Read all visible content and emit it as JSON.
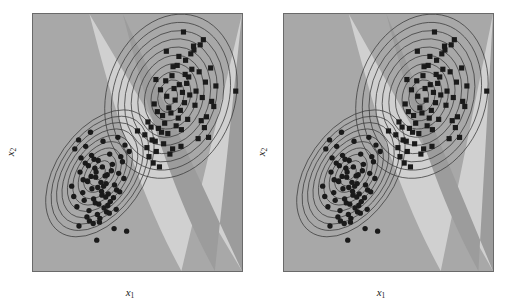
{
  "figure": {
    "title": "",
    "panel_count": 2,
    "background_color": "#ffffff"
  },
  "axes": {
    "x_label_var": "x",
    "x_label_sub": "1",
    "y_label_var": "x",
    "y_label_sub": "2",
    "ticks_visible": false,
    "frame_color": "#6a6a6a"
  },
  "colors": {
    "region_class1": "#a8a8a8",
    "region_margin": "#d0d0d0",
    "region_class2": "#9c9c9c",
    "contour_line": "#3a3a3a",
    "marker": "#1a1a1a",
    "frame": "#6a6a6a",
    "page": "#ffffff"
  },
  "chart_data": {
    "type": "scatter",
    "title": "",
    "xlabel": "x1",
    "ylabel": "x2",
    "xlim": [
      0,
      100
    ],
    "ylim": [
      0,
      100
    ],
    "grid": false,
    "legend": "none",
    "panels": [
      {
        "name": "left-panel",
        "label": "",
        "decision_regions": [
          {
            "name": "class2-region-upper",
            "color": "#9c9c9c"
          },
          {
            "name": "margin-band",
            "color": "#d0d0d0"
          },
          {
            "name": "class1-region-lower",
            "color": "#a8a8a8"
          }
        ],
        "boundary_note": "curved quadratic boundary running from upper-left to lower-right, with a light margin band between two darker regions",
        "contours": [
          {
            "name": "class1-gaussian",
            "center": [
              32,
              38
            ],
            "angle_deg": -55,
            "levels": 10,
            "max_rx": 34,
            "max_ry": 17
          },
          {
            "name": "class2-gaussian",
            "center": [
              66,
              68
            ],
            "angle_deg": -72,
            "levels": 10,
            "max_rx": 40,
            "max_ry": 25
          }
        ],
        "series": [
          {
            "name": "class-1",
            "marker": "circle",
            "color": "#1a1a1a",
            "x": [
              27.5,
              40.6,
              20.0,
              33.5,
              25.0,
              36.7,
              44.0,
              29.6,
              22.5,
              31.2,
              38.0,
              26.0,
              34.5,
              42.0,
              18.5,
              30.0,
              23.8,
              37.5,
              28.2,
              35.0,
              24.5,
              32.8,
              41.0,
              21.0,
              29.0,
              33.0,
              26.8,
              39.0,
              31.5,
              36.0,
              25.8,
              34.0,
              43.5,
              27.0,
              30.8,
              38.5,
              22.0,
              35.8,
              28.8,
              32.0,
              46.0,
              19.5,
              33.8,
              40.0,
              24.0,
              29.8,
              37.0,
              31.0,
              26.5,
              35.2,
              23.0,
              42.8,
              30.2,
              34.8,
              27.8,
              39.8,
              25.2,
              32.5,
              36.5,
              28.0,
              44.8,
              21.8,
              31.8,
              38.8,
              33.2,
              29.2,
              35.5,
              26.2,
              41.5,
              30.5
            ],
            "y": [
              54.0,
              52.0,
              47.5,
              50.5,
              42.0,
              45.5,
              49.0,
              40.0,
              38.5,
              43.0,
              41.5,
              35.0,
              37.0,
              44.5,
              33.0,
              36.5,
              30.5,
              39.0,
              32.0,
              34.0,
              27.5,
              31.0,
              38.0,
              25.0,
              28.0,
              29.5,
              23.5,
              33.5,
              26.0,
              30.0,
              21.0,
              24.5,
              36.0,
              19.5,
              22.0,
              28.5,
              17.5,
              25.5,
              18.5,
              20.5,
              46.5,
              29.0,
              33.0,
              31.5,
              35.5,
              26.5,
              27.0,
              32.5,
              41.0,
              23.0,
              44.0,
              42.5,
              38.5,
              28.8,
              36.8,
              24.0,
              48.5,
              34.5,
              22.5,
              45.0,
              15.5,
              51.0,
              19.0,
              16.5,
              40.5,
              43.5,
              37.5,
              34.8,
              30.8,
              12.0
            ]
          },
          {
            "name": "class-2",
            "marker": "square",
            "color": "#1a1a1a",
            "x": [
              55.0,
              72.0,
              63.5,
              80.0,
              58.0,
              69.0,
              75.5,
              61.0,
              85.0,
              66.5,
              53.5,
              77.0,
              70.0,
              59.5,
              82.5,
              64.0,
              73.0,
              56.5,
              68.0,
              79.5,
              62.0,
              86.5,
              71.5,
              57.0,
              74.5,
              65.0,
              81.0,
              60.0,
              67.5,
              76.0,
              54.5,
              83.0,
              69.5,
              63.0,
              78.0,
              58.5,
              72.5,
              66.0,
              84.0,
              61.5,
              70.5,
              55.5,
              80.5,
              64.5,
              75.0,
              59.0,
              68.5,
              87.5,
              73.5,
              62.5,
              77.5,
              57.5,
              71.0,
              66.8,
              82.0,
              60.5,
              74.0,
              85.5,
              65.5,
              79.0,
              97.0,
              50.0,
              69.8,
              63.8,
              76.8,
              58.8,
              72.8,
              67.0,
              81.5,
              70.8
            ],
            "y": [
              58.0,
              93.0,
              74.0,
              88.0,
              65.0,
              80.0,
              84.5,
              70.5,
              79.0,
              76.0,
              53.0,
              86.0,
              72.5,
              62.0,
              73.5,
              68.0,
              82.0,
              56.0,
              66.5,
              77.5,
              60.5,
              64.0,
              69.5,
              51.0,
              75.5,
              63.5,
              67.5,
              55.5,
              71.0,
              78.5,
              48.0,
              60.0,
              59.5,
              57.5,
              70.0,
              50.5,
              65.5,
              61.5,
              52.0,
              54.0,
              62.5,
              44.5,
              58.5,
              53.5,
              68.5,
              46.5,
              56.5,
              72.0,
              73.0,
              49.5,
              64.5,
              42.0,
              55.0,
              47.5,
              55.8,
              40.5,
              59.0,
              66.0,
              45.5,
              51.5,
              70.0,
              54.5,
              83.5,
              85.5,
              87.5,
              74.5,
              76.5,
              79.5,
              90.0,
              48.5
            ]
          }
        ]
      },
      {
        "name": "right-panel",
        "label": "",
        "decision_regions": [
          {
            "name": "class2-region-upper",
            "color": "#9c9c9c"
          },
          {
            "name": "margin-band",
            "color": "#d0d0d0"
          },
          {
            "name": "class1-region-lower",
            "color": "#a8a8a8"
          }
        ],
        "boundary_note": "same data, slightly wider margin band; boundary shifted right at bottom",
        "contours": [
          {
            "name": "class1-gaussian",
            "center": [
              32,
              38
            ],
            "angle_deg": -55,
            "levels": 10,
            "max_rx": 34,
            "max_ry": 17
          },
          {
            "name": "class2-gaussian",
            "center": [
              66,
              68
            ],
            "angle_deg": -72,
            "levels": 10,
            "max_rx": 40,
            "max_ry": 25
          }
        ],
        "series": [
          {
            "name": "class-1",
            "marker": "circle",
            "color": "#1a1a1a",
            "x": [
              27.5,
              40.6,
              20.0,
              33.5,
              25.0,
              36.7,
              44.0,
              29.6,
              22.5,
              31.2,
              38.0,
              26.0,
              34.5,
              42.0,
              18.5,
              30.0,
              23.8,
              37.5,
              28.2,
              35.0,
              24.5,
              32.8,
              41.0,
              21.0,
              29.0,
              33.0,
              26.8,
              39.0,
              31.5,
              36.0,
              25.8,
              34.0,
              43.5,
              27.0,
              30.8,
              38.5,
              22.0,
              35.8,
              28.8,
              32.0,
              46.0,
              19.5,
              33.8,
              40.0,
              24.0,
              29.8,
              37.0,
              31.0,
              26.5,
              35.2,
              23.0,
              42.8,
              30.2,
              34.8,
              27.8,
              39.8,
              25.2,
              32.5,
              36.5,
              28.0,
              44.8,
              21.8,
              31.8,
              38.8,
              33.2,
              29.2,
              35.5,
              26.2,
              41.5,
              30.5
            ],
            "y": [
              54.0,
              52.0,
              47.5,
              50.5,
              42.0,
              45.5,
              49.0,
              40.0,
              38.5,
              43.0,
              41.5,
              35.0,
              37.0,
              44.5,
              33.0,
              36.5,
              30.5,
              39.0,
              32.0,
              34.0,
              27.5,
              31.0,
              38.0,
              25.0,
              28.0,
              29.5,
              23.5,
              33.5,
              26.0,
              30.0,
              21.0,
              24.5,
              36.0,
              19.5,
              22.0,
              28.5,
              17.5,
              25.5,
              18.5,
              20.5,
              46.5,
              29.0,
              33.0,
              31.5,
              35.5,
              26.5,
              27.0,
              32.5,
              41.0,
              23.0,
              44.0,
              42.5,
              38.5,
              28.8,
              36.8,
              24.0,
              48.5,
              34.5,
              22.5,
              45.0,
              15.5,
              51.0,
              19.0,
              16.5,
              40.5,
              43.5,
              37.5,
              34.8,
              30.8,
              12.0
            ]
          },
          {
            "name": "class-2",
            "marker": "square",
            "color": "#1a1a1a",
            "x": [
              55.0,
              72.0,
              63.5,
              80.0,
              58.0,
              69.0,
              75.5,
              61.0,
              85.0,
              66.5,
              53.5,
              77.0,
              70.0,
              59.5,
              82.5,
              64.0,
              73.0,
              56.5,
              68.0,
              79.5,
              62.0,
              86.5,
              71.5,
              57.0,
              74.5,
              65.0,
              81.0,
              60.0,
              67.5,
              76.0,
              54.5,
              83.0,
              69.5,
              63.0,
              78.0,
              58.5,
              72.5,
              66.0,
              84.0,
              61.5,
              70.5,
              55.5,
              80.5,
              64.5,
              75.0,
              59.0,
              68.5,
              87.5,
              73.5,
              62.5,
              77.5,
              57.5,
              71.0,
              66.8,
              82.0,
              60.5,
              74.0,
              85.5,
              65.5,
              79.0,
              97.0,
              50.0,
              69.8,
              63.8,
              76.8,
              58.8,
              72.8,
              67.0,
              81.5,
              70.8
            ],
            "y": [
              58.0,
              93.0,
              74.0,
              88.0,
              65.0,
              80.0,
              84.5,
              70.5,
              79.0,
              76.0,
              53.0,
              86.0,
              72.5,
              62.0,
              73.5,
              68.0,
              82.0,
              56.0,
              66.5,
              77.5,
              60.5,
              64.0,
              69.5,
              51.0,
              75.5,
              63.5,
              67.5,
              55.5,
              71.0,
              78.5,
              48.0,
              60.0,
              59.5,
              57.5,
              70.0,
              50.5,
              65.5,
              61.5,
              52.0,
              54.0,
              62.5,
              44.5,
              58.5,
              53.5,
              68.5,
              46.5,
              56.5,
              72.0,
              73.0,
              49.5,
              64.5,
              42.0,
              55.0,
              47.5,
              55.8,
              40.5,
              59.0,
              66.0,
              45.5,
              51.5,
              70.0,
              54.5,
              83.5,
              85.5,
              87.5,
              74.5,
              76.5,
              79.5,
              90.0,
              48.5
            ]
          }
        ]
      }
    ]
  }
}
